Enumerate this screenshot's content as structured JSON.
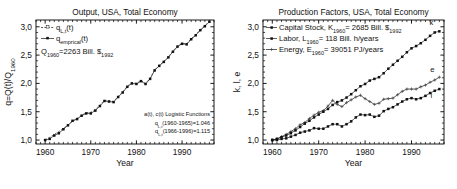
{
  "figure": {
    "panels": [
      "left",
      "right"
    ]
  },
  "chart_data": [
    {
      "id": "output-usa",
      "type": "line",
      "title": "Output, USA, Total Economy",
      "xlabel": "Year",
      "ylabel": "q=Q(t)/Q1960",
      "ylabel_parts": {
        "main": "q=Q(t)/Q",
        "sub": "1960"
      },
      "xlim": [
        1958,
        1997
      ],
      "ylim": [
        0.93,
        3.12
      ],
      "xticks": [
        1960,
        1970,
        1980,
        1990
      ],
      "xtick_labels": [
        "1960",
        "1970",
        "1980",
        "1990"
      ],
      "yticks": [
        1.0,
        1.5,
        2.0,
        2.5,
        3.0
      ],
      "ytick_labels": [
        "1,0",
        "1,5",
        "2,0",
        "2,5",
        "3,0"
      ],
      "grid": false,
      "legend_position": "top-left",
      "legend": [
        {
          "label": "qL,t(t)",
          "label_main": "q",
          "label_sub": "L,t",
          "label_tail": "(t)",
          "marker": "open-square",
          "style": "dashed"
        },
        {
          "label": "qemprical(t)",
          "label_main": "q",
          "label_sub": "emprical",
          "label_tail": "(t)",
          "marker": "filled-square",
          "style": "solid"
        }
      ],
      "legend_note": {
        "main": "Q",
        "sub": "1960",
        "tail": "=2263 Bill. $",
        "tail_sub": "1992"
      },
      "annotations": [
        "a(t), c(t) Logistic Functions",
        "qL,t(1960-1965)=1.046",
        "qL,t(1966-1996)=1.115"
      ],
      "annotation_parts": [
        {
          "main": "a(t), c(t) Logistic Functions",
          "sub": "",
          "tail": ""
        },
        {
          "main": "q",
          "sub": "L,t",
          "tail": "(1960-1965)=1.046"
        },
        {
          "main": "q",
          "sub": "L,t",
          "tail": "(1966-1996)=1.115"
        }
      ],
      "x": [
        1960,
        1961,
        1962,
        1963,
        1964,
        1965,
        1966,
        1967,
        1968,
        1969,
        1970,
        1971,
        1972,
        1973,
        1974,
        1975,
        1976,
        1977,
        1978,
        1979,
        1980,
        1981,
        1982,
        1983,
        1984,
        1985,
        1986,
        1987,
        1988,
        1989,
        1990,
        1991,
        1992,
        1993,
        1994,
        1995,
        1996
      ],
      "series": [
        {
          "name": "q_empirical",
          "values": [
            1.0,
            1.02,
            1.08,
            1.12,
            1.19,
            1.26,
            1.34,
            1.37,
            1.43,
            1.47,
            1.47,
            1.52,
            1.6,
            1.69,
            1.68,
            1.67,
            1.76,
            1.84,
            1.94,
            2.0,
            1.99,
            2.04,
            1.99,
            2.08,
            2.23,
            2.31,
            2.38,
            2.46,
            2.56,
            2.65,
            2.7,
            2.69,
            2.78,
            2.85,
            2.94,
            3.01,
            3.09
          ]
        },
        {
          "name": "q_L,t",
          "values": [
            1.0,
            1.05,
            1.1,
            1.15,
            1.21,
            1.26,
            1.33,
            1.38,
            1.44,
            1.48,
            1.49,
            1.54,
            1.62,
            1.7,
            1.69,
            1.68,
            1.77,
            1.85,
            1.95,
            2.01,
            2.0,
            2.05,
            2.0,
            2.09,
            2.24,
            2.32,
            2.39,
            2.47,
            2.57,
            2.66,
            2.71,
            2.7,
            2.79,
            2.86,
            2.95,
            3.02,
            3.1
          ]
        }
      ]
    },
    {
      "id": "production-factors-usa",
      "type": "line",
      "title": "Production Factors, USA, Total Economy",
      "xlabel": "Year",
      "ylabel": "k, l, e",
      "xlim": [
        1958,
        1997
      ],
      "ylim": [
        0.93,
        3.12
      ],
      "xticks": [
        1960,
        1970,
        1980,
        1990
      ],
      "xtick_labels": [
        "1960",
        "1970",
        "1980",
        "1990"
      ],
      "yticks": [
        1.0,
        1.5,
        2.0,
        2.5,
        3.0
      ],
      "ytick_labels": [
        "1,0",
        "1,5",
        "2,0",
        "2,5",
        "3,0"
      ],
      "grid": false,
      "legend_position": "top-left",
      "legend": [
        {
          "main": "Capital Stock, K",
          "sub": "1960",
          "tail": "= 2685 Bill. $",
          "tail_sub": "1992",
          "marker": "filled-square",
          "style": "solid"
        },
        {
          "main": "Labor, L",
          "sub": "1960",
          "tail": "= 118 Bill. h/years",
          "tail_sub": "",
          "marker": "filled-square",
          "style": "solid"
        },
        {
          "main": "Energy, E",
          "sub": "1960",
          "tail": "= 39051 PJ/years",
          "tail_sub": "",
          "marker": "cross",
          "style": "solid"
        }
      ],
      "curve_labels": [
        {
          "text": "k",
          "series": "k"
        },
        {
          "text": "e",
          "series": "e"
        },
        {
          "text": "l",
          "series": "l"
        }
      ],
      "x": [
        1960,
        1961,
        1962,
        1963,
        1964,
        1965,
        1966,
        1967,
        1968,
        1969,
        1970,
        1971,
        1972,
        1973,
        1974,
        1975,
        1976,
        1977,
        1978,
        1979,
        1980,
        1981,
        1982,
        1983,
        1984,
        1985,
        1986,
        1987,
        1988,
        1989,
        1990,
        1991,
        1992,
        1993,
        1994,
        1995,
        1996
      ],
      "series": [
        {
          "name": "k",
          "label": "Capital Stock",
          "values": [
            1.0,
            1.02,
            1.05,
            1.08,
            1.12,
            1.17,
            1.23,
            1.29,
            1.34,
            1.4,
            1.45,
            1.5,
            1.55,
            1.62,
            1.67,
            1.7,
            1.75,
            1.81,
            1.88,
            1.95,
            1.99,
            2.05,
            2.08,
            2.11,
            2.18,
            2.26,
            2.33,
            2.4,
            2.47,
            2.55,
            2.62,
            2.66,
            2.71,
            2.77,
            2.84,
            2.9,
            2.92
          ]
        },
        {
          "name": "l",
          "label": "Labor",
          "values": [
            1.0,
            1.0,
            1.02,
            1.03,
            1.06,
            1.09,
            1.13,
            1.15,
            1.17,
            1.21,
            1.2,
            1.2,
            1.24,
            1.28,
            1.28,
            1.24,
            1.28,
            1.33,
            1.4,
            1.45,
            1.44,
            1.45,
            1.41,
            1.43,
            1.51,
            1.55,
            1.58,
            1.63,
            1.68,
            1.72,
            1.74,
            1.72,
            1.74,
            1.78,
            1.83,
            1.87,
            1.9
          ]
        },
        {
          "name": "e",
          "label": "Energy",
          "values": [
            1.0,
            1.02,
            1.06,
            1.1,
            1.15,
            1.2,
            1.27,
            1.31,
            1.38,
            1.44,
            1.49,
            1.52,
            1.6,
            1.7,
            1.63,
            1.59,
            1.66,
            1.71,
            1.76,
            1.79,
            1.73,
            1.68,
            1.63,
            1.65,
            1.72,
            1.73,
            1.74,
            1.8,
            1.86,
            1.9,
            1.9,
            1.9,
            1.94,
            1.97,
            2.02,
            2.06,
            2.11
          ]
        }
      ]
    }
  ]
}
